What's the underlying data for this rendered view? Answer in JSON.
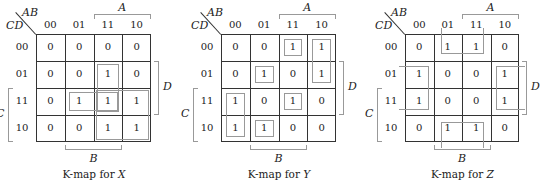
{
  "kmaps": [
    {
      "caption_prefix": "K-map for ",
      "output": "X",
      "row_var": "CD",
      "col_var": "AB",
      "col_headers": [
        "00",
        "01",
        "11",
        "10"
      ],
      "row_headers": [
        "00",
        "01",
        "11",
        "10"
      ],
      "cells": [
        [
          "0",
          "0",
          "0",
          "0"
        ],
        [
          "0",
          "0",
          "1",
          "0"
        ],
        [
          "0",
          "1",
          "1",
          "1"
        ],
        [
          "0",
          "0",
          "1",
          "1"
        ]
      ],
      "bracket_labels": {
        "top": "A",
        "right": "D",
        "left": "C",
        "bottom": "B"
      }
    },
    {
      "caption_prefix": "K-map for ",
      "output": "Y",
      "row_var": "CD",
      "col_var": "AB",
      "col_headers": [
        "00",
        "01",
        "11",
        "10"
      ],
      "row_headers": [
        "00",
        "01",
        "11",
        "10"
      ],
      "cells": [
        [
          "0",
          "0",
          "1",
          "1"
        ],
        [
          "0",
          "1",
          "0",
          "1"
        ],
        [
          "1",
          "0",
          "1",
          "0"
        ],
        [
          "1",
          "1",
          "0",
          "0"
        ]
      ],
      "bracket_labels": {
        "top": "A",
        "right": "D",
        "left": "C",
        "bottom": "B"
      }
    },
    {
      "caption_prefix": "K-map for ",
      "output": "Z",
      "row_var": "CD",
      "col_var": "AB",
      "col_headers": [
        "00",
        "01",
        "11",
        "10"
      ],
      "row_headers": [
        "00",
        "01",
        "11",
        "10"
      ],
      "cells": [
        [
          "0",
          "1",
          "1",
          "0"
        ],
        [
          "1",
          "0",
          "0",
          "1"
        ],
        [
          "1",
          "0",
          "0",
          "1"
        ],
        [
          "0",
          "1",
          "1",
          "0"
        ]
      ],
      "bracket_labels": {
        "top": "A",
        "right": "D",
        "left": "C",
        "bottom": "B"
      }
    }
  ],
  "colors": {
    "grid": "#333333",
    "loop": "#999999",
    "text": "#222222"
  }
}
